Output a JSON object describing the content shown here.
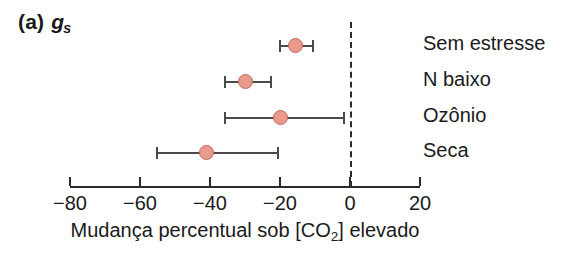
{
  "panel": {
    "letter": "(a)",
    "metric": "g",
    "metric_subscript": "s"
  },
  "axis": {
    "title_prefix": "Mudança percentual sob [CO",
    "title_subscript": "2",
    "title_suffix": "] elevado",
    "tick_labels": [
      "−80",
      "−60",
      "−40",
      "−20",
      "0",
      "20"
    ]
  },
  "colors": {
    "marker_fill": "#ea9a8d",
    "marker_edge": "#c2695d",
    "errorbar": "#4a4a4a",
    "axis": "#2b2b2b",
    "text": "#1a1a1a"
  },
  "rows": [
    {
      "label": "Sem estresse"
    },
    {
      "label": "N baixo"
    },
    {
      "label": "Ozônio"
    },
    {
      "label": "Seca"
    }
  ],
  "chart_data": {
    "type": "scatter",
    "orientation": "horizontal",
    "xlabel": "Mudança percentual sob [CO2] elevado",
    "ylabel": "",
    "xlim": [
      -80,
      20
    ],
    "xticks": [
      -80,
      -60,
      -40,
      -20,
      0,
      20
    ],
    "grid": false,
    "legend": false,
    "reference_line": {
      "x": 0,
      "style": "dashed"
    },
    "categories": [
      "Sem estresse",
      "N baixo",
      "Ozônio",
      "Seca"
    ],
    "values": [
      -15.5,
      -30.0,
      -20.0,
      -41.0
    ],
    "error_low": [
      -20.0,
      -35.7,
      -35.7,
      -55.1
    ],
    "error_high": [
      -10.5,
      -22.5,
      -1.7,
      -20.5
    ],
    "points": [
      {
        "category": "Sem estresse",
        "value": -15.5,
        "ci_low": -20.0,
        "ci_high": -10.5
      },
      {
        "category": "N baixo",
        "value": -30.0,
        "ci_low": -35.7,
        "ci_high": -22.5
      },
      {
        "category": "Ozônio",
        "value": -20.0,
        "ci_low": -35.7,
        "ci_high": -1.7
      },
      {
        "category": "Seca",
        "value": -41.0,
        "ci_low": -55.1,
        "ci_high": -20.5
      }
    ]
  }
}
